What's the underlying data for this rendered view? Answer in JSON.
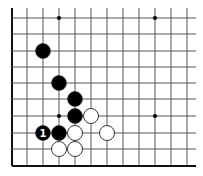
{
  "diagram": {
    "grid": {
      "x_lines": [
        12,
        27,
        43,
        59,
        75,
        91,
        107,
        123,
        139,
        155,
        171,
        187
      ],
      "y_lines": [
        18,
        34,
        51,
        67,
        83,
        99,
        116,
        133,
        149,
        166
      ],
      "right_end": 196,
      "top_end": 8,
      "line_color": "#555555",
      "edge_color": "#111111"
    },
    "star_points": [
      [
        3,
        0
      ],
      [
        9,
        0
      ],
      [
        3,
        6
      ],
      [
        9,
        6
      ]
    ],
    "stones": [
      {
        "color": "black",
        "col": 2,
        "row": 2,
        "label": ""
      },
      {
        "color": "black",
        "col": 3,
        "row": 4,
        "label": ""
      },
      {
        "color": "black",
        "col": 4,
        "row": 5,
        "label": ""
      },
      {
        "color": "black",
        "col": 4,
        "row": 6,
        "label": ""
      },
      {
        "color": "white",
        "col": 5,
        "row": 6,
        "label": ""
      },
      {
        "color": "black",
        "col": 2,
        "row": 7,
        "label": "1"
      },
      {
        "color": "black",
        "col": 3,
        "row": 7,
        "label": ""
      },
      {
        "color": "white",
        "col": 4,
        "row": 7,
        "label": ""
      },
      {
        "color": "white",
        "col": 6,
        "row": 7,
        "label": ""
      },
      {
        "color": "white",
        "col": 3,
        "row": 8,
        "label": ""
      },
      {
        "color": "white",
        "col": 4,
        "row": 8,
        "label": ""
      }
    ],
    "stone_radius": 7.5,
    "colors": {
      "black": "#000000",
      "white": "#ffffff",
      "outline": "#222222"
    }
  }
}
